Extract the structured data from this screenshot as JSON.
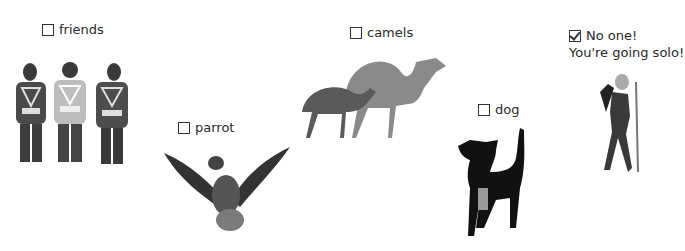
{
  "options": [
    {
      "id": "friends",
      "label": "friends",
      "checked": false
    },
    {
      "id": "parrot",
      "label": "parrot",
      "checked": false
    },
    {
      "id": "camels",
      "label": "camels",
      "checked": false
    },
    {
      "id": "dog",
      "label": "dog",
      "checked": false
    },
    {
      "id": "solo",
      "label": "No one!",
      "checked": true,
      "subtext": "You're going solo!"
    }
  ],
  "colors": {
    "ink": "#2a2a2a",
    "checkbox_border": "#333333",
    "background": "#ffffff"
  }
}
